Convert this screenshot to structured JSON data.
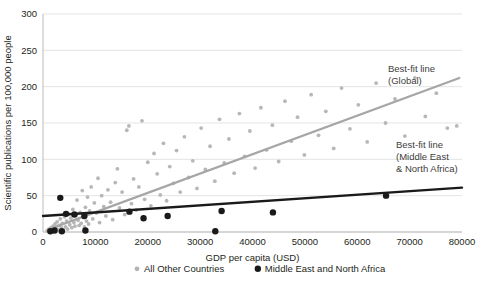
{
  "chart_data": {
    "type": "scatter",
    "title": "",
    "xlabel": "GDP per capita (USD)",
    "ylabel": "Scientific publications per 100,000 people",
    "xlim": [
      0,
      80000
    ],
    "ylim": [
      0,
      300
    ],
    "xticks": [
      0,
      10000,
      20000,
      30000,
      40000,
      50000,
      60000,
      70000,
      80000
    ],
    "xticklabels": [
      "0",
      "10000",
      "20000",
      "30000",
      "40000",
      "50000",
      "60000",
      "70000",
      "80000"
    ],
    "yticks": [
      0,
      50,
      100,
      150,
      200,
      250,
      300
    ],
    "yticklabels": [
      "0",
      "50",
      "100",
      "150",
      "200",
      "250",
      "300"
    ],
    "grid": "horizontal",
    "legend_position": "bottom",
    "colors": {
      "other_countries": "#b3b3b3",
      "mena": "#1a1a1a",
      "global_fit_line": "#a6a6a6",
      "mena_fit_line": "#1a1a1a",
      "gridline": "#d9d9d9",
      "text": "#231f20"
    },
    "series": [
      {
        "name": "All Other Countries",
        "marker": "circle",
        "color": "#b3b3b3",
        "points": [
          [
            800,
            2
          ],
          [
            1100,
            4
          ],
          [
            1300,
            1
          ],
          [
            1500,
            6
          ],
          [
            1700,
            3
          ],
          [
            1900,
            8
          ],
          [
            2100,
            2
          ],
          [
            2300,
            11
          ],
          [
            2500,
            5
          ],
          [
            2700,
            14
          ],
          [
            2900,
            3
          ],
          [
            3100,
            9
          ],
          [
            3300,
            18
          ],
          [
            3500,
            6
          ],
          [
            3700,
            12
          ],
          [
            3900,
            2
          ],
          [
            4100,
            21
          ],
          [
            4300,
            7
          ],
          [
            4500,
            15
          ],
          [
            4700,
            4
          ],
          [
            4900,
            25
          ],
          [
            5100,
            10
          ],
          [
            5300,
            19
          ],
          [
            5500,
            6
          ],
          [
            5700,
            31
          ],
          [
            5900,
            13
          ],
          [
            6100,
            8
          ],
          [
            6300,
            23
          ],
          [
            6500,
            44
          ],
          [
            6700,
            16
          ],
          [
            6900,
            9
          ],
          [
            7100,
            27
          ],
          [
            7300,
            12
          ],
          [
            7500,
            57
          ],
          [
            7700,
            20
          ],
          [
            7900,
            7
          ],
          [
            8100,
            34
          ],
          [
            8300,
            15
          ],
          [
            8500,
            48
          ],
          [
            8700,
            11
          ],
          [
            8900,
            29
          ],
          [
            9200,
            62
          ],
          [
            9500,
            18
          ],
          [
            9800,
            40
          ],
          [
            10200,
            26
          ],
          [
            10500,
            74
          ],
          [
            10800,
            13
          ],
          [
            11200,
            50
          ],
          [
            11600,
            35
          ],
          [
            12000,
            22
          ],
          [
            12400,
            58
          ],
          [
            12900,
            41
          ],
          [
            13300,
            17
          ],
          [
            13800,
            68
          ],
          [
            14200,
            87
          ],
          [
            14600,
            33
          ],
          [
            15100,
            55
          ],
          [
            15600,
            24
          ],
          [
            16000,
            140
          ],
          [
            16400,
            146
          ],
          [
            16900,
            39
          ],
          [
            17300,
            73
          ],
          [
            17800,
            30
          ],
          [
            18300,
            62
          ],
          [
            18900,
            153
          ],
          [
            19400,
            45
          ],
          [
            20000,
            96
          ],
          [
            20600,
            36
          ],
          [
            21200,
            108
          ],
          [
            21800,
            80
          ],
          [
            22400,
            51
          ],
          [
            23000,
            122
          ],
          [
            23600,
            43
          ],
          [
            24200,
            90
          ],
          [
            24900,
            67
          ],
          [
            25500,
            112
          ],
          [
            26200,
            55
          ],
          [
            27000,
            131
          ],
          [
            27800,
            75
          ],
          [
            28600,
            98
          ],
          [
            29400,
            60
          ],
          [
            30200,
            143
          ],
          [
            31000,
            86
          ],
          [
            31900,
            118
          ],
          [
            32800,
            70
          ],
          [
            33700,
            155
          ],
          [
            34600,
            95
          ],
          [
            35500,
            128
          ],
          [
            36500,
            81
          ],
          [
            37500,
            163
          ],
          [
            38500,
            104
          ],
          [
            39500,
            139
          ],
          [
            40500,
            88
          ],
          [
            41600,
            171
          ],
          [
            42700,
            113
          ],
          [
            43800,
            147
          ],
          [
            45000,
            97
          ],
          [
            46200,
            180
          ],
          [
            47400,
            125
          ],
          [
            48600,
            158
          ],
          [
            49900,
            106
          ],
          [
            51200,
            189
          ],
          [
            52600,
            133
          ],
          [
            54000,
            166
          ],
          [
            55500,
            115
          ],
          [
            57000,
            198
          ],
          [
            58600,
            142
          ],
          [
            60200,
            175
          ],
          [
            61900,
            124
          ],
          [
            63600,
            205
          ],
          [
            65400,
            150
          ],
          [
            67200,
            183
          ],
          [
            69100,
            132
          ],
          [
            71000,
            212
          ],
          [
            73000,
            159
          ],
          [
            75100,
            191
          ],
          [
            77200,
            143
          ],
          [
            79000,
            146
          ]
        ]
      },
      {
        "name": "Middle East and North Africa",
        "marker": "circle",
        "color": "#1a1a1a",
        "points": [
          [
            1400,
            1
          ],
          [
            2200,
            2
          ],
          [
            3300,
            47
          ],
          [
            3600,
            1
          ],
          [
            4400,
            25
          ],
          [
            6000,
            24
          ],
          [
            7900,
            22
          ],
          [
            8100,
            2
          ],
          [
            16500,
            28
          ],
          [
            19200,
            19
          ],
          [
            23800,
            22
          ],
          [
            32900,
            1
          ],
          [
            34100,
            29
          ],
          [
            43900,
            27
          ],
          [
            65500,
            50
          ]
        ]
      }
    ],
    "trend_lines": [
      {
        "name": "Best-fit line (Global)",
        "color": "#a6a6a6",
        "x_start": 2000,
        "y_start": 6,
        "x_end": 79500,
        "y_end": 212,
        "width": 2.2
      },
      {
        "name": "Best-fit line (Middle East & North Africa)",
        "color": "#1a1a1a",
        "x_start": 0,
        "y_start": 22,
        "x_end": 80000,
        "y_end": 61,
        "width": 2.4
      }
    ],
    "annotations": [
      {
        "id": "global-fit-annotation",
        "lines": [
          "Best-fit line",
          "(Global)"
        ],
        "x_px": 388,
        "y_px": 72
      },
      {
        "id": "mena-fit-annotation",
        "lines": [
          "Best-fit line",
          "(Middle East",
          "& North Africa)"
        ],
        "x_px": 396,
        "y_px": 148
      }
    ],
    "legend": [
      {
        "label": "All Other Countries",
        "color": "#b3b3b3",
        "marker_size": 2.4
      },
      {
        "label": "Middle East and North Africa",
        "color": "#1a1a1a",
        "marker_size": 3.2
      }
    ]
  }
}
